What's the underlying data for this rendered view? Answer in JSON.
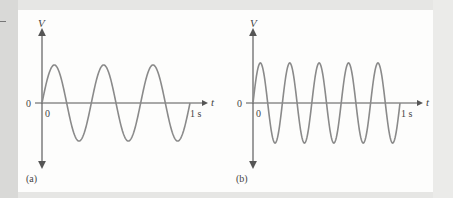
{
  "figure": {
    "panels": [
      {
        "id": "a",
        "caption": "(a)",
        "y_axis_label": "V",
        "x_axis_label": "t",
        "origin_left_label": "0",
        "origin_below_label": "0",
        "end_time_label": "1 s",
        "cycles": 3
      },
      {
        "id": "b",
        "caption": "(b)",
        "y_axis_label": "V",
        "x_axis_label": "t",
        "origin_left_label": "0",
        "origin_below_label": "0",
        "end_time_label": "1 s",
        "cycles": 5
      }
    ]
  },
  "chart_data": [
    {
      "type": "line",
      "title": "(a)",
      "xlabel": "t",
      "ylabel": "V",
      "function": "sine",
      "x_range": [
        0,
        1
      ],
      "x_unit": "s",
      "cycles": 3,
      "frequency_hz": 3,
      "xticks": [
        "0",
        "1 s"
      ],
      "yticks": [
        "0"
      ],
      "grid": false
    },
    {
      "type": "line",
      "title": "(b)",
      "xlabel": "t",
      "ylabel": "V",
      "function": "sine",
      "x_range": [
        0,
        1
      ],
      "x_unit": "s",
      "cycles": 5,
      "frequency_hz": 5,
      "xticks": [
        "0",
        "1 s"
      ],
      "yticks": [
        "0"
      ],
      "grid": false
    }
  ],
  "colors": {
    "axis": "#555555",
    "curve": "#8a8a8a",
    "panel_bg": "#fdfdfc",
    "page_bg": "#e6e6e4"
  }
}
